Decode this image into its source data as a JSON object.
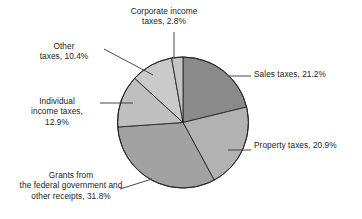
{
  "chart_data": {
    "type": "pie",
    "title": "",
    "subtitle": "",
    "xlabel": "",
    "ylabel": "",
    "legend_position": "none",
    "grid": false,
    "labels_outside": true,
    "total_percent": "100.0%",
    "categories": [
      "Sales taxes",
      "Property taxes",
      "Grants from the federal government and other receipts",
      "Individual income taxes",
      "Other taxes",
      "Corporate income taxes"
    ],
    "values": [
      21.2,
      20.9,
      31.8,
      12.9,
      10.4,
      2.8
    ],
    "value_labels": [
      "21.2%",
      "20.9%",
      "31.8%",
      "12.9%",
      "10.4%",
      "2.8%"
    ],
    "colors": [
      "#8a8a8a",
      "#b2b2b2",
      "#a2a2a2",
      "#bfbfbf",
      "#cacaca",
      "#c4c4c4"
    ],
    "slice_outline_color": "#262626",
    "start_angle_deg": 0,
    "direction": "clockwise",
    "slices": [
      {
        "name": "sales-taxes",
        "label_lines": [
          "Sales taxes, 21.2%"
        ],
        "value": 21.2,
        "percent_text": "21.2%",
        "color": "#8a8a8a"
      },
      {
        "name": "property-taxes",
        "label_lines": [
          "Property taxes, 20.9%"
        ],
        "value": 20.9,
        "percent_text": "20.9%",
        "color": "#b2b2b2"
      },
      {
        "name": "grants-federal-government",
        "label_lines": [
          "Grants from",
          "the federal government and",
          "other receipts, 31.8%"
        ],
        "value": 31.8,
        "percent_text": "31.8%",
        "color": "#a2a2a2"
      },
      {
        "name": "individual-income-taxes",
        "label_lines": [
          "Individual",
          "income taxes,",
          "12.9%"
        ],
        "value": 12.9,
        "percent_text": "12.9%",
        "color": "#bfbfbf"
      },
      {
        "name": "other-taxes",
        "label_lines": [
          "Other",
          "taxes, 10.4%"
        ],
        "value": 10.4,
        "percent_text": "10.4%",
        "color": "#cacaca"
      },
      {
        "name": "corporate-income-taxes",
        "label_lines": [
          "Corporate income",
          "taxes, 2.8%"
        ],
        "value": 2.8,
        "percent_text": "2.8%",
        "color": "#c4c4c4"
      }
    ]
  },
  "labels": {
    "corporate_line1": "Corporate income",
    "corporate_line2": "taxes, 2.8%",
    "sales": "Sales taxes, 21.2%",
    "property": "Property taxes, 20.9%",
    "grants_line1": "Grants from",
    "grants_line2": "the federal government and",
    "grants_line3": "other receipts, 31.8%",
    "individual_line1": "Individual",
    "individual_line2": "income taxes,",
    "individual_line3": "12.9%",
    "other_line1": "Other",
    "other_line2": "taxes, 10.4%"
  }
}
